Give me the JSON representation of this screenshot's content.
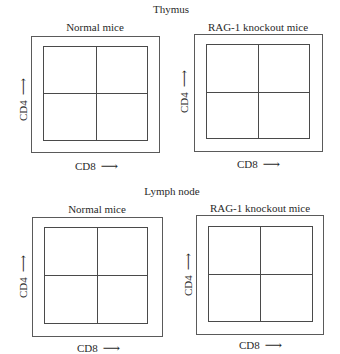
{
  "sections": [
    {
      "title": "Thymus",
      "panels": [
        {
          "title": "Normal mice",
          "x_axis": "CD8",
          "y_axis": "CD4",
          "arrow": "⟶"
        },
        {
          "title": "RAG-1 knockout mice",
          "x_axis": "CD8",
          "y_axis": "CD4",
          "arrow": "⟶"
        }
      ]
    },
    {
      "title": "Lymph node",
      "panels": [
        {
          "title": "Normal mice",
          "x_axis": "CD8",
          "y_axis": "CD4",
          "arrow": "⟶"
        },
        {
          "title": "RAG-1 knockout mice",
          "x_axis": "CD8",
          "y_axis": "CD4",
          "arrow": "⟶"
        }
      ]
    }
  ],
  "colors": {
    "line": "#4a4a4a",
    "text": "#2a2a2a",
    "background": "#ffffff"
  }
}
